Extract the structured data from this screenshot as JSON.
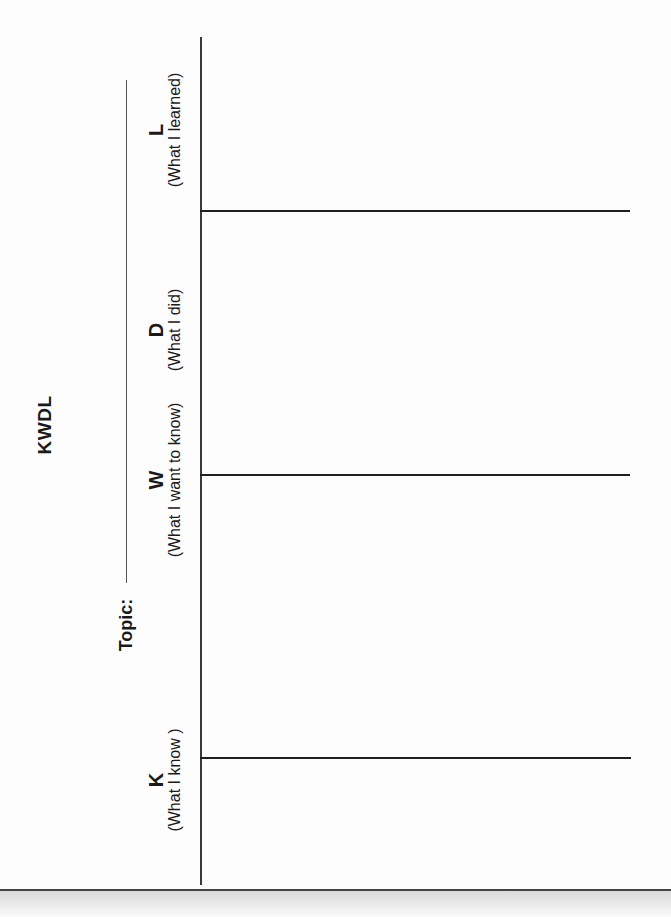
{
  "document": {
    "title": "KWDL",
    "topic_label": "Topic:",
    "topic_value": "",
    "orientation": "rotated-90-ccw",
    "columns": [
      {
        "letter": "K",
        "subtitle": "(What I know )"
      },
      {
        "letter": "W",
        "subtitle": "(What I want to know)"
      },
      {
        "letter": "D",
        "subtitle": "(What I did)"
      },
      {
        "letter": "L",
        "subtitle": "(What I learned)"
      }
    ],
    "colors": {
      "background": "#ffffff",
      "ink": "#1a1a1a",
      "lines": "#2a2a2a"
    }
  }
}
